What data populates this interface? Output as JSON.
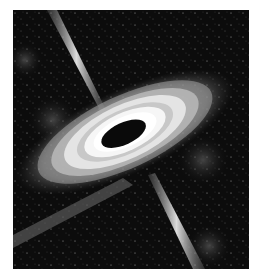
{
  "image": {
    "subject": "black hole with accretion disk and relativistic jets",
    "style": "grayscale illustration",
    "background_color": "#0c0c0c",
    "page_color": "#ffffff"
  }
}
